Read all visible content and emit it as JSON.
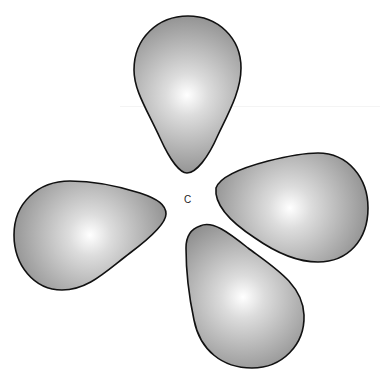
{
  "diagram": {
    "title": "",
    "center_atom": {
      "label": "C",
      "position": [
        188,
        202
      ]
    },
    "lobe_count": 4,
    "lobes": [
      {
        "name": "top",
        "highlight": [
          187,
          95
        ],
        "tip": [
          187,
          173
        ]
      },
      {
        "name": "left",
        "highlight": [
          90,
          235
        ],
        "tip": [
          166,
          212
        ]
      },
      {
        "name": "right",
        "highlight": [
          290,
          208
        ],
        "tip": [
          215,
          196
        ]
      },
      {
        "name": "bottom",
        "highlight": [
          243,
          297
        ],
        "tip": [
          198,
          226
        ]
      }
    ],
    "colors": {
      "background": "#ffffff",
      "lobe_fill_center": "#ffffff",
      "lobe_fill_edge": "#8a8a8a",
      "outline": "#111111",
      "label": "#222222"
    }
  }
}
